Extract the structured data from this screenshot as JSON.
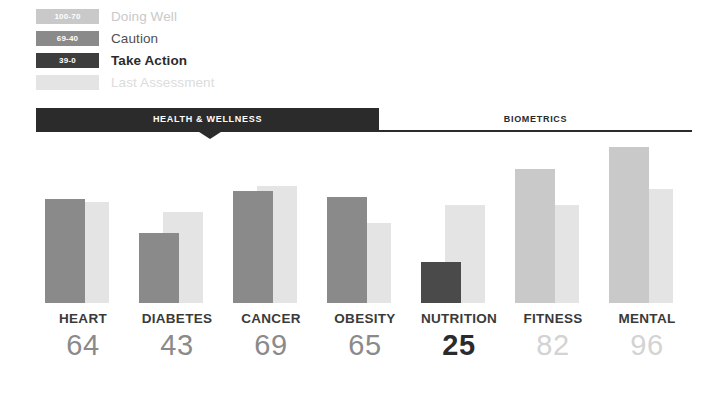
{
  "legend": {
    "items": [
      {
        "range": "100-70",
        "label": "Doing Well",
        "swatch_color": "#c9c9c9",
        "text_color": "#c9c9c9",
        "bold": false
      },
      {
        "range": "69-40",
        "label": "Caution",
        "swatch_color": "#8a8a8a",
        "text_color": "#4f4f4f",
        "bold": false
      },
      {
        "range": "39-0",
        "label": "Take Action",
        "swatch_color": "#3d3d3d",
        "text_color": "#2b2b2b",
        "bold": true
      },
      {
        "range": "",
        "label": "Last Assessment",
        "swatch_color": "#e4e4e4",
        "text_color": "#dcdcdc",
        "bold": false
      }
    ]
  },
  "tabs": {
    "active_label": "HEALTH & WELLNESS",
    "inactive_label": "BIOMETRICS",
    "active_bg": "#2b2b2b",
    "inactive_text": "#2b2b2b"
  },
  "chart_data": {
    "type": "bar",
    "title": "",
    "xlabel": "",
    "ylabel": "",
    "ylim": [
      0,
      100
    ],
    "grid": false,
    "legend_position": "top-left",
    "categories": [
      "HEART",
      "DIABETES",
      "CANCER",
      "OBESITY",
      "NUTRITION",
      "FITNESS",
      "MENTAL"
    ],
    "series": [
      {
        "name": "Current",
        "values": [
          64,
          43,
          69,
          65,
          25,
          82,
          96
        ]
      },
      {
        "name": "Last Assessment",
        "values": [
          62,
          56,
          72,
          49,
          60,
          60,
          70
        ]
      }
    ],
    "bands": [
      {
        "name": "Doing Well",
        "range": "100-70",
        "color": "#c9c9c9"
      },
      {
        "name": "Caution",
        "range": "69-40",
        "color": "#8a8a8a"
      },
      {
        "name": "Take Action",
        "range": "39-0",
        "color": "#3d3d3d"
      }
    ],
    "bar_colors": [
      "#8a8a8a",
      "#8a8a8a",
      "#8a8a8a",
      "#8a8a8a",
      "#4a4a4a",
      "#c9c9c9",
      "#c9c9c9"
    ],
    "value_colors": [
      "#8a8a8a",
      "#8a8a8a",
      "#8a8a8a",
      "#8a8a8a",
      "#2b2b2b",
      "#d3d3d3",
      "#d3d3d3"
    ],
    "value_bold": [
      false,
      false,
      false,
      false,
      true,
      false,
      false
    ],
    "prev_color": "#e4e4e4"
  }
}
